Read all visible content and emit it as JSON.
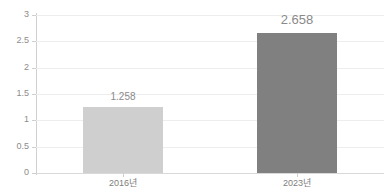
{
  "chart_data": {
    "type": "bar",
    "title": "",
    "subtitle": "",
    "xlabel": "",
    "ylabel": "",
    "categories": [
      "2016년",
      "2023년"
    ],
    "values": [
      1.258,
      2.658
    ],
    "value_labels": [
      "1.258",
      "2.658"
    ],
    "series": [
      {
        "name": "",
        "values": [
          1.258,
          2.658
        ]
      }
    ],
    "ylim": [
      0,
      3
    ],
    "y_ticks": [
      0,
      0.5,
      1,
      1.5,
      2,
      2.5,
      3
    ],
    "y_tick_labels": [
      "0",
      "0.5",
      "1",
      "1.5",
      "2",
      "2.5",
      "3"
    ],
    "grid": true,
    "legend": false,
    "legend_position": "none",
    "bar_colors": [
      "#cfcfcf",
      "#808080"
    ],
    "label_color": "#8a8a8a",
    "tick_label_color": "#8c8c8c",
    "gridline_color": "#ededed",
    "axis_color": "#d0d0d0",
    "background_color": "#ffffff"
  }
}
